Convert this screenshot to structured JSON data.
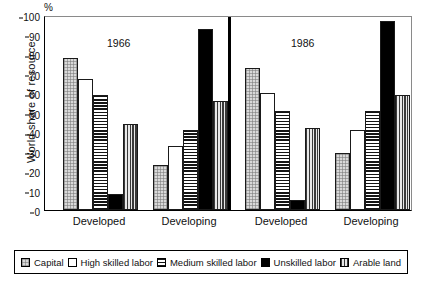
{
  "chart_data": {
    "type": "bar",
    "title": "",
    "xlabel": "",
    "ylabel": "World share of resource",
    "unit_label": "%",
    "ylim": [
      0,
      100
    ],
    "yticks": [
      0,
      10,
      20,
      30,
      40,
      50,
      60,
      70,
      80,
      90,
      100
    ],
    "grid": false,
    "legend_position": "bottom",
    "panels": [
      {
        "year": "1966",
        "groups": [
          "Developed",
          "Developing"
        ]
      },
      {
        "year": "1986",
        "groups": [
          "Developed",
          "Developing"
        ]
      }
    ],
    "categories": [
      "1966 Developed",
      "1966 Developing",
      "1986 Developed",
      "1986 Developing"
    ],
    "series": [
      {
        "name": "Capital",
        "pattern": "stipple",
        "values": [
          78,
          23,
          73,
          29
        ]
      },
      {
        "name": "High skilled labor",
        "pattern": "white",
        "values": [
          67,
          33,
          60,
          41
        ]
      },
      {
        "name": "Medium skilled labor",
        "pattern": "horizontal-stripe",
        "values": [
          59,
          41,
          51,
          51
        ]
      },
      {
        "name": "Unskilled labor",
        "pattern": "solid-black",
        "values": [
          8,
          93,
          5,
          97
        ]
      },
      {
        "name": "Arable land",
        "pattern": "vertical-stripe",
        "values": [
          44,
          56,
          42,
          59
        ]
      }
    ]
  },
  "axis": {
    "unit": "%",
    "title": "World share of resource",
    "ticks": [
      "100",
      "90",
      "80",
      "70",
      "60",
      "50",
      "40",
      "30",
      "20",
      "10",
      "0"
    ]
  },
  "years": {
    "first": "1966",
    "second": "1986"
  },
  "group_labels": {
    "a": "Developed",
    "b": "Developing",
    "c": "Developed",
    "d": "Developing"
  },
  "legend": {
    "items": [
      {
        "label": "Capital"
      },
      {
        "label": "High skilled labor"
      },
      {
        "label": "Medium skilled labor"
      },
      {
        "label": "Unskilled labor"
      },
      {
        "label": "Arable land"
      }
    ]
  }
}
